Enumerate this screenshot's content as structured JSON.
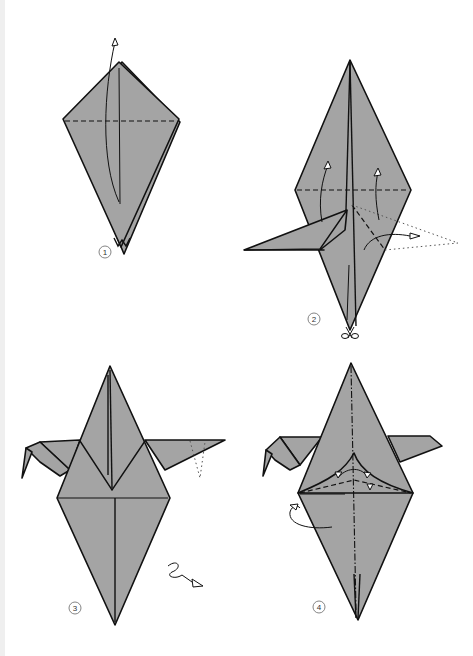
{
  "colors": {
    "paper": "#a4a4a4",
    "outline": "#111111",
    "background": "#ffffff"
  },
  "steps": [
    {
      "number": "1",
      "instruction_symbols": [
        "valley-fold-line",
        "fold-up-arrow"
      ]
    },
    {
      "number": "2",
      "instruction_symbols": [
        "valley-fold-line",
        "fold-up-arrows",
        "reverse-fold-arrow",
        "dotted-outline-result",
        "scissors-cut"
      ]
    },
    {
      "number": "3",
      "instruction_symbols": [
        "dotted-reverse-fold",
        "turn-over-arrow"
      ]
    },
    {
      "number": "4",
      "instruction_symbols": [
        "mountain-fold-line",
        "valley-fold-line",
        "fold-arrows",
        "tuck-arrow"
      ]
    }
  ]
}
